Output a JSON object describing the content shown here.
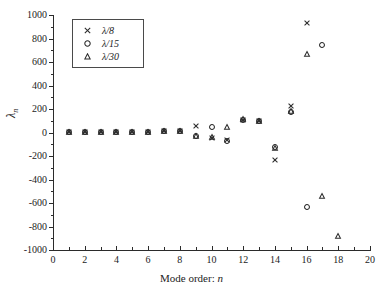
{
  "chart_data": {
    "type": "scatter",
    "title": "",
    "xlabel": "Mode order: n",
    "ylabel": "λₙ",
    "xlim": [
      0,
      20
    ],
    "ylim": [
      -1000,
      1000
    ],
    "xticks": [
      0,
      2,
      4,
      6,
      8,
      10,
      12,
      14,
      16,
      18,
      20
    ],
    "yticks": [
      -1000,
      -800,
      -600,
      -400,
      -200,
      0,
      200,
      400,
      600,
      800,
      1000
    ],
    "xtick_labels": [
      "0",
      "2",
      "4",
      "6",
      "8",
      "10",
      "12",
      "14",
      "16",
      "18",
      "20"
    ],
    "ytick_labels": [
      "-1000",
      "-800",
      "-600",
      "-400",
      "-200",
      "0",
      "200",
      "400",
      "600",
      "800",
      "1000"
    ],
    "grid": false,
    "legend_position": "upper-left",
    "series": [
      {
        "name": "λ/8",
        "marker": "cross",
        "x": [
          1,
          2,
          3,
          4,
          5,
          6,
          7,
          8,
          9,
          10,
          11,
          12,
          13,
          14,
          15,
          16
        ],
        "y": [
          2,
          3,
          4,
          5,
          6,
          8,
          10,
          14,
          55,
          -45,
          -65,
          110,
          100,
          -235,
          225,
          930
        ]
      },
      {
        "name": "λ/15",
        "marker": "circle",
        "x": [
          1,
          2,
          3,
          4,
          5,
          6,
          7,
          8,
          9,
          10,
          11,
          12,
          13,
          14,
          15,
          16,
          17
        ],
        "y": [
          2,
          3,
          4,
          5,
          6,
          7,
          9,
          12,
          -30,
          45,
          -70,
          108,
          95,
          -120,
          175,
          -630,
          745
        ]
      },
      {
        "name": "λ/30",
        "marker": "triangle",
        "x": [
          1,
          2,
          3,
          4,
          5,
          6,
          7,
          8,
          9,
          10,
          11,
          12,
          13,
          14,
          15,
          16,
          17,
          18
        ],
        "y": [
          2,
          3,
          4,
          5,
          6,
          7,
          9,
          12,
          -28,
          -40,
          45,
          115,
          98,
          -128,
          180,
          670,
          -540,
          -880
        ]
      }
    ]
  },
  "legend": {
    "entries": [
      {
        "label": "λ/8",
        "marker": "cross"
      },
      {
        "label": "λ/15",
        "marker": "circle"
      },
      {
        "label": "λ/30",
        "marker": "triangle"
      }
    ]
  },
  "axis_titles": {
    "x_prefix": "Mode order: ",
    "x_italic": "n",
    "y": "λ",
    "y_sub": "n"
  }
}
